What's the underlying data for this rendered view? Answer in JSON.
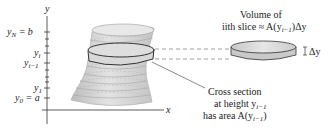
{
  "axes": {
    "x_label": "x",
    "y_label": "y"
  },
  "y_ticks": [
    {
      "label": "y",
      "sub": "N",
      "suffix": " = b",
      "y": 32
    },
    {
      "label": "y",
      "sub": "i",
      "suffix": "",
      "y": 53
    },
    {
      "label": "y",
      "sub": "i−1",
      "suffix": "",
      "y": 63
    },
    {
      "label": "y",
      "sub": "1",
      "suffix": "",
      "y": 88
    },
    {
      "label": "y",
      "sub": "0",
      "suffix": " = a",
      "y": 98
    }
  ],
  "annotations": {
    "volume_line1": "Volume of",
    "volume_line2_prefix": "ith slice ≈ A(y",
    "volume_line2_sub": "i−1",
    "volume_line2_suffix": ")Δy",
    "delta_y": "Δy",
    "cross_line1": "Cross section",
    "cross_line2_prefix": "at height y",
    "cross_line2_sub": "i−1",
    "cross_line3_prefix": "has area A(y",
    "cross_line3_sub": "i−1",
    "cross_line3_suffix": ")"
  },
  "colors": {
    "solid_fill": "#d4d4d4",
    "solid_top": "#e6e6e6",
    "outline": "#333333",
    "dash": "#888888"
  }
}
